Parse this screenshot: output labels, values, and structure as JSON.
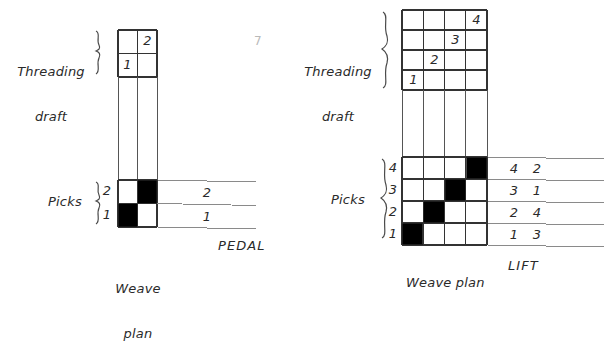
{
  "page": {
    "background": "#ffffff",
    "ink": "#2a2a2a",
    "fill_color": "#000000",
    "width": 612,
    "height": 304
  },
  "left_diagram": {
    "threading_label_line1": "Threading",
    "threading_label_line2": "draft",
    "picks_label": "Picks",
    "weave_label_line1": "Weave",
    "weave_label_line2": "plan",
    "treadling_header": "PEDAL",
    "threading_draft": {
      "type": "table",
      "columns": 2,
      "rows": 2,
      "cells": [
        {
          "row": 1,
          "col": 2,
          "value": "2"
        },
        {
          "row": 2,
          "col": 1,
          "value": "1"
        }
      ]
    },
    "weave_plan": {
      "type": "table",
      "columns": 2,
      "rows": 2,
      "pick_labels": [
        "2",
        "1"
      ],
      "filled": [
        {
          "row": 1,
          "col": 2
        },
        {
          "row": 2,
          "col": 1
        }
      ]
    },
    "pedal_column": {
      "rows": [
        "2",
        "1"
      ]
    }
  },
  "right_diagram": {
    "threading_label_line1": "Threading",
    "threading_label_line2": "draft",
    "picks_label": "Picks",
    "weave_label": "Weave plan",
    "treadling_header": "LIFT",
    "threading_draft": {
      "type": "table",
      "columns": 4,
      "rows": 4,
      "cells": [
        {
          "row": 1,
          "col": 4,
          "value": "4"
        },
        {
          "row": 2,
          "col": 3,
          "value": "3"
        },
        {
          "row": 3,
          "col": 2,
          "value": "2"
        },
        {
          "row": 4,
          "col": 1,
          "value": "1"
        }
      ]
    },
    "weave_plan": {
      "type": "table",
      "columns": 4,
      "rows": 4,
      "pick_labels": [
        "4",
        "3",
        "2",
        "1"
      ],
      "filled": [
        {
          "row": 1,
          "col": 4
        },
        {
          "row": 2,
          "col": 3
        },
        {
          "row": 3,
          "col": 2
        },
        {
          "row": 4,
          "col": 1
        }
      ]
    },
    "lift_column": {
      "rows": [
        {
          "first": "4",
          "second": "2"
        },
        {
          "first": "3",
          "second": "1"
        },
        {
          "first": "2",
          "second": "4"
        },
        {
          "first": "1",
          "second": "3"
        }
      ]
    }
  },
  "stray_marks": {
    "page_number": "7"
  }
}
